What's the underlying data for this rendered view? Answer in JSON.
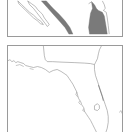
{
  "figure": {
    "panels": [
      {
        "id": "inset",
        "description": "Zoomed coastal detail with shaded barrier island / lagoon areas",
        "colors": {
          "outline": "#8c8c8c",
          "fill_shaded": "#7a7a7a",
          "background": "#ffffff",
          "frame": "#9a9a9a"
        }
      },
      {
        "id": "overview",
        "description": "Outline map of Florida",
        "colors": {
          "outline": "#8c8c8c",
          "background": "#ffffff",
          "frame": "#9a9a9a"
        }
      }
    ]
  }
}
